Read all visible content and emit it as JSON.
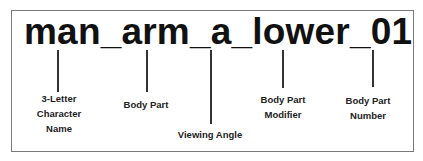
{
  "diagram": {
    "filename": "man_arm_a_lower_01",
    "labels": [
      {
        "text_lines": [
          "3-Letter",
          "Character",
          "Name"
        ]
      },
      {
        "text_lines": [
          "Body Part"
        ]
      },
      {
        "text_lines": [
          "Viewing Angle"
        ]
      },
      {
        "text_lines": [
          "Body Part",
          "Modifier"
        ]
      },
      {
        "text_lines": [
          "Body Part",
          "Number"
        ]
      }
    ]
  }
}
